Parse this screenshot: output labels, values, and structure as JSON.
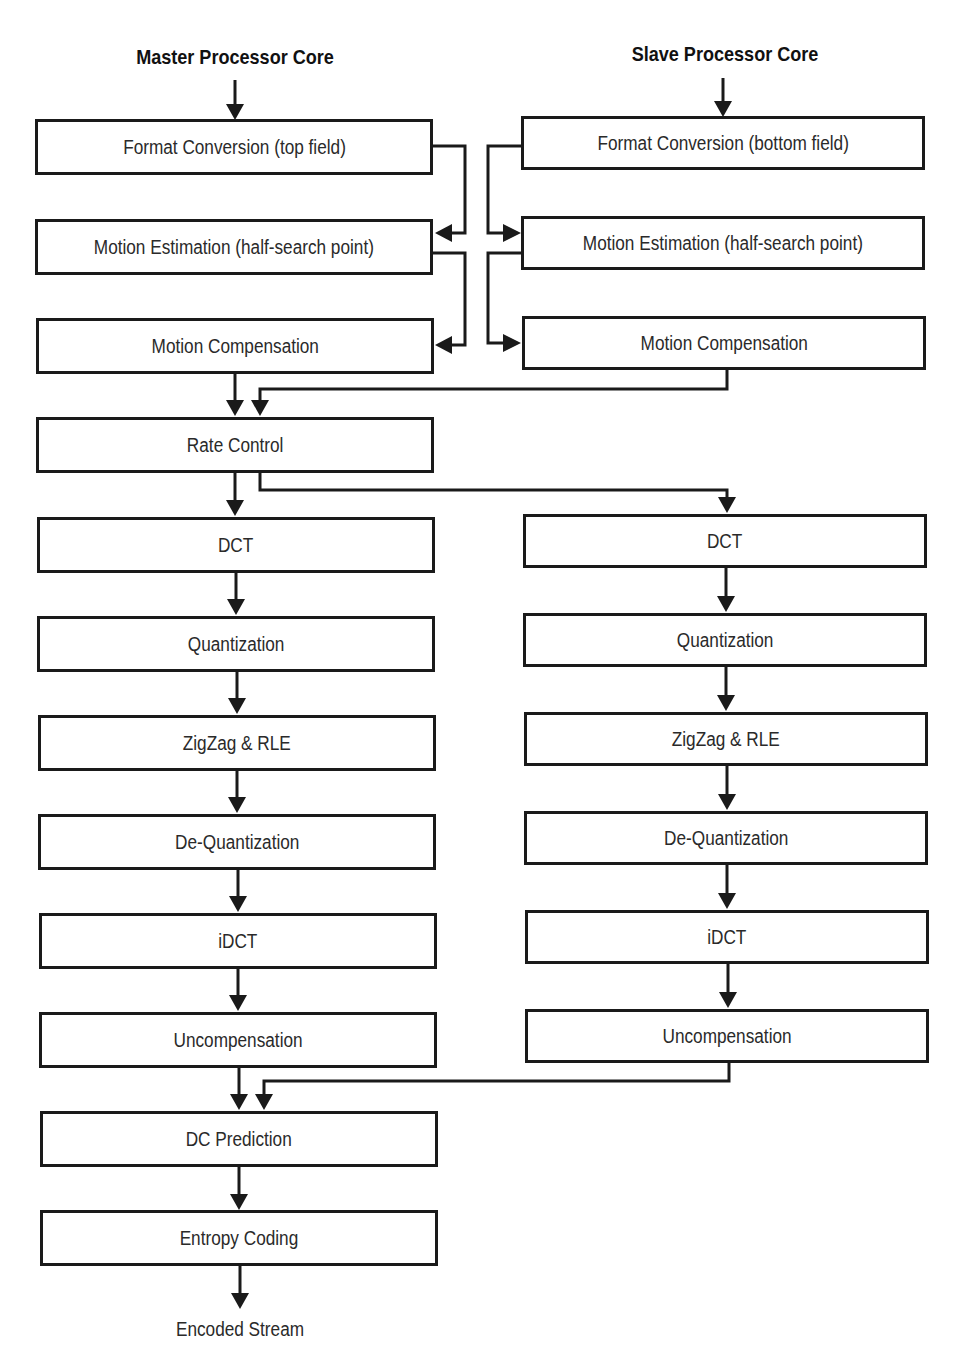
{
  "diagram": {
    "master_title": "Master Processor Core",
    "slave_title": "Slave Processor Core",
    "master": [
      "Format Conversion (top field)",
      "Motion Estimation (half-search point)",
      "Motion Compensation",
      "Rate Control",
      "DCT",
      "Quantization",
      "ZigZag & RLE",
      "De-Quantization",
      "iDCT",
      "Uncompensation",
      "DC Prediction",
      "Entropy Coding"
    ],
    "slave": [
      "Format Conversion (bottom field)",
      "Motion Estimation (half-search point)",
      "Motion Compensation",
      "DCT",
      "Quantization",
      "ZigZag & RLE",
      "De-Quantization",
      "iDCT",
      "Uncompensation"
    ],
    "output_label": "Encoded Stream"
  }
}
